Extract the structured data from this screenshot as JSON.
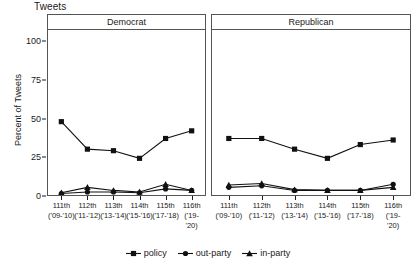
{
  "chart_data": {
    "type": "line",
    "title": "Tweets",
    "xlabel": "",
    "ylabel": "Percent of Tweets",
    "ylim": [
      0,
      108
    ],
    "yticks": [
      0,
      25,
      50,
      75,
      100
    ],
    "ytick_labels": [
      "0",
      "25",
      "50",
      "75",
      "100"
    ],
    "grid": false,
    "legend_position": "bottom",
    "categories": [
      "111th",
      "112th",
      "113th",
      "114th",
      "115th",
      "116th"
    ],
    "category_sublabels": [
      "('09-'10)",
      "('11-'12)",
      "('13-'14)",
      "('15-'16)",
      "('17-'18)",
      "('19-'20)"
    ],
    "panels": [
      {
        "name": "Democrat",
        "series": [
          {
            "name": "policy",
            "marker": "square",
            "values": [
              48,
              30,
              29,
              24,
              37,
              42
            ]
          },
          {
            "name": "out-party",
            "marker": "circle",
            "values": [
              1,
              2,
              2,
              1.5,
              4,
              3
            ]
          },
          {
            "name": "in-party",
            "marker": "triangle",
            "values": [
              1.5,
              5,
              3,
              2,
              7,
              3
            ]
          }
        ]
      },
      {
        "name": "Republican",
        "series": [
          {
            "name": "policy",
            "marker": "square",
            "values": [
              37,
              37,
              30,
              24,
              33,
              36
            ]
          },
          {
            "name": "out-party",
            "marker": "circle",
            "values": [
              5,
              6,
              3,
              3,
              3,
              7
            ]
          },
          {
            "name": "in-party",
            "marker": "triangle",
            "values": [
              6.5,
              7.5,
              3.5,
              3,
              3,
              5
            ]
          }
        ]
      }
    ],
    "legend": [
      {
        "label": "policy",
        "marker": "square"
      },
      {
        "label": "out-party",
        "marker": "circle"
      },
      {
        "label": "in-party",
        "marker": "triangle"
      }
    ],
    "colors": {
      "line": "#111111",
      "marker": "#111111",
      "axis": "#555555",
      "text": "#1a1a1a"
    }
  }
}
